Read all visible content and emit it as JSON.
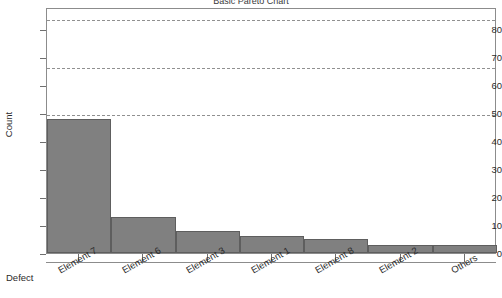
{
  "chart_data": {
    "type": "bar",
    "title": "Basic Pareto Chart",
    "xlabel": "Defect",
    "ylabel": "Count",
    "categories": [
      "Element 7",
      "Element 6",
      "Element 3",
      "Element 1",
      "Element 8",
      "Element 2",
      "Others"
    ],
    "values": [
      48,
      13,
      8,
      6,
      5,
      3,
      3
    ],
    "ylim": [
      0,
      88
    ],
    "yticks": [
      0,
      10,
      20,
      30,
      40,
      50,
      60,
      70,
      80
    ],
    "ytick_labels": [
      "0",
      "10",
      "20",
      "30",
      "40",
      "50",
      "60",
      "70",
      "80"
    ],
    "reference_lines": [
      50,
      67,
      84
    ],
    "grid": false,
    "legend": "none",
    "bar_color": "#808080",
    "bar_edge_color": "#5e5e5e",
    "reference_line_color": "#909090",
    "axis_color": "#8c8c8c"
  }
}
